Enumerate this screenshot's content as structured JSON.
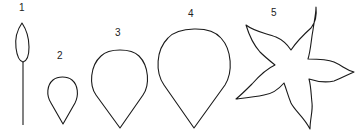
{
  "figure": {
    "stroke_color": "#1a1a1a",
    "background": "#ffffff",
    "shapes": [
      {
        "label": "1",
        "name": "narrow leaf with stem"
      },
      {
        "label": "2",
        "name": "small teardrop petal"
      },
      {
        "label": "3",
        "name": "medium teardrop petal"
      },
      {
        "label": "4",
        "name": "large teardrop petal"
      },
      {
        "label": "5",
        "name": "five-pointed star flower"
      }
    ]
  }
}
